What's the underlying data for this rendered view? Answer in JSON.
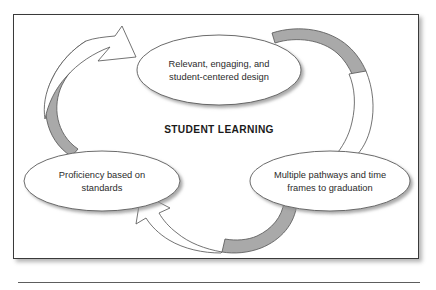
{
  "figure": {
    "center_label": "STUDENT LEARNING",
    "nodes": [
      {
        "id": "design",
        "position": "top",
        "line1": "Relevant, engaging, and",
        "line2": "student-centered design"
      },
      {
        "id": "proficiency",
        "position": "left",
        "line1": "Proficiency based on",
        "line2": "standards"
      },
      {
        "id": "pathways",
        "position": "right",
        "line1": "Multiple pathways and time",
        "line2": "frames to graduation"
      }
    ],
    "arrows": [
      {
        "id": "left-arrow",
        "from": "proficiency",
        "to": "design",
        "direction": "clockwise"
      },
      {
        "id": "right-arrow",
        "from": "design",
        "to": "pathways",
        "direction": "clockwise"
      },
      {
        "id": "bottom-arrow",
        "from": "pathways",
        "to": "proficiency",
        "direction": "clockwise"
      }
    ],
    "colors": {
      "arrow_shade": "#a9a9a9",
      "arrow_fill": "#ffffff",
      "outline": "#555555",
      "text": "#2b2b2b",
      "center_text": "#1a1a1a",
      "frame_border": "#3a3a3a",
      "background": "#ffffff",
      "rule": "#5d5d5d"
    }
  }
}
